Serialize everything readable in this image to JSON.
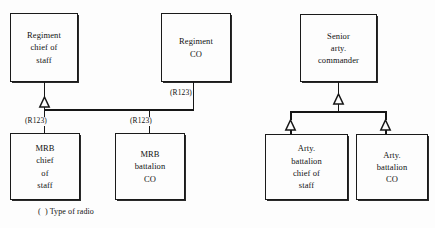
{
  "diagram": {
    "line_color": "#161616",
    "text_color": "#111111",
    "background": "#fdfdfd",
    "nodes": [
      {
        "id": "regiment-chief-of-staff",
        "label": "Regiment\nchief of\nstaff"
      },
      {
        "id": "regiment-co",
        "label": "Regiment\nCO"
      },
      {
        "id": "mrb-chief-of-staff",
        "label": "MRB\nchief\nof\nstaff"
      },
      {
        "id": "mrb-battalion-co",
        "label": "MRB\nbattalion\nCO"
      },
      {
        "id": "senior-arty-commander",
        "label": "Senior\narty.\ncommander"
      },
      {
        "id": "arty-battalion-chief-of-staff",
        "label": "Arty.\nbattalion\nchief of\nstaff"
      },
      {
        "id": "arty-battalion-co",
        "label": "Arty.\nbattalion\nCO"
      }
    ],
    "radio_tags": [
      {
        "id": "regiment-co-radio",
        "text": "(R123)"
      },
      {
        "id": "mrb-chief-of-staff-radio",
        "text": "(R123)"
      },
      {
        "id": "mrb-battalion-co-radio",
        "text": "(R123)"
      }
    ],
    "legend": {
      "text": "(  ) Type of radio"
    }
  }
}
